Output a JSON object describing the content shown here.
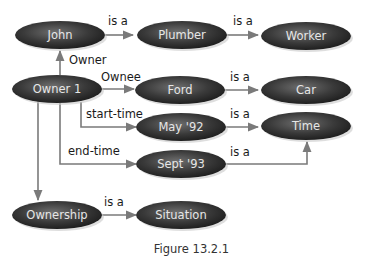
{
  "diagram": {
    "type": "semantic-network",
    "caption": "Figure 13.2.1",
    "nodes": [
      {
        "id": "john",
        "label": "John",
        "cx": 60,
        "cy": 35
      },
      {
        "id": "plumber",
        "label": "Plumber",
        "cx": 182,
        "cy": 35
      },
      {
        "id": "worker",
        "label": "Worker",
        "cx": 306,
        "cy": 36
      },
      {
        "id": "owner1",
        "label": "Owner 1",
        "cx": 57,
        "cy": 89
      },
      {
        "id": "ford",
        "label": "Ford",
        "cx": 180,
        "cy": 90
      },
      {
        "id": "car",
        "label": "Car",
        "cx": 306,
        "cy": 90
      },
      {
        "id": "may92",
        "label": "May '92",
        "cx": 181,
        "cy": 127
      },
      {
        "id": "time",
        "label": "Time",
        "cx": 306,
        "cy": 126
      },
      {
        "id": "sept93",
        "label": "Sept '93",
        "cx": 181,
        "cy": 164
      },
      {
        "id": "ownership",
        "label": "Ownership",
        "cx": 57,
        "cy": 215
      },
      {
        "id": "situation",
        "label": "Situation",
        "cx": 181,
        "cy": 215
      }
    ],
    "edges": [
      {
        "from": "john",
        "to": "plumber",
        "label": "is a"
      },
      {
        "from": "plumber",
        "to": "worker",
        "label": "is a"
      },
      {
        "from": "owner1",
        "to": "john",
        "label": "Owner"
      },
      {
        "from": "owner1",
        "to": "ford",
        "label": "Ownee"
      },
      {
        "from": "ford",
        "to": "car",
        "label": "is a"
      },
      {
        "from": "owner1",
        "to": "may92",
        "label": "start-time"
      },
      {
        "from": "may92",
        "to": "time",
        "label": "is a"
      },
      {
        "from": "owner1",
        "to": "sept93",
        "label": "end-time"
      },
      {
        "from": "sept93",
        "to": "time",
        "label": "is a"
      },
      {
        "from": "owner1",
        "to": "ownership",
        "label": ""
      },
      {
        "from": "ownership",
        "to": "situation",
        "label": "is a"
      }
    ],
    "colors": {
      "node_dark": "#1f1f1f",
      "node_light": "#6e6e6e",
      "node_text": "#e6e6e6",
      "edge": "#7a7a7a",
      "label_text": "#1a1a1a"
    }
  }
}
